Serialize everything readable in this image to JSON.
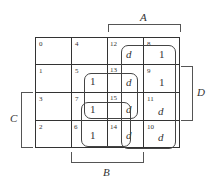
{
  "kmap": {
    "variables": {
      "top": "A",
      "right": "D",
      "left": "C",
      "bottom": "B"
    },
    "cells": [
      {
        "index": "0",
        "value": "",
        "row": 0,
        "col": 0
      },
      {
        "index": "4",
        "value": "",
        "row": 0,
        "col": 1
      },
      {
        "index": "12",
        "value": "d",
        "row": 0,
        "col": 2
      },
      {
        "index": "8",
        "value": "1",
        "row": 0,
        "col": 3
      },
      {
        "index": "1",
        "value": "",
        "row": 1,
        "col": 0
      },
      {
        "index": "5",
        "value": "1",
        "row": 1,
        "col": 1
      },
      {
        "index": "13",
        "value": "d",
        "row": 1,
        "col": 2
      },
      {
        "index": "9",
        "value": "1",
        "row": 1,
        "col": 3
      },
      {
        "index": "3",
        "value": "",
        "row": 2,
        "col": 0
      },
      {
        "index": "7",
        "value": "1",
        "row": 2,
        "col": 1
      },
      {
        "index": "15",
        "value": "d",
        "row": 2,
        "col": 2
      },
      {
        "index": "11",
        "value": "d",
        "row": 2,
        "col": 3
      },
      {
        "index": "2",
        "value": "",
        "row": 3,
        "col": 0
      },
      {
        "index": "6",
        "value": "1",
        "row": 3,
        "col": 1
      },
      {
        "index": "14",
        "value": "d",
        "row": 3,
        "col": 2
      },
      {
        "index": "10",
        "value": "d",
        "row": 3,
        "col": 3
      }
    ],
    "groupings": [
      {
        "name": "A-group",
        "cells": [
          "12",
          "8",
          "13",
          "9",
          "15",
          "11",
          "14",
          "10"
        ]
      },
      {
        "name": "BD-group",
        "cells": [
          "5",
          "13",
          "7",
          "15"
        ]
      },
      {
        "name": "BC-group",
        "cells": [
          "7",
          "15",
          "6",
          "14"
        ]
      }
    ]
  }
}
